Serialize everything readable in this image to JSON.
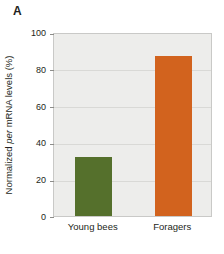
{
  "panel": {
    "label": "A"
  },
  "chart_data": {
    "type": "bar",
    "title": "",
    "xlabel": "",
    "ylabel_prefix": "Normalized ",
    "ylabel_gene": "per",
    "ylabel_suffix": " mRNA levels (%)",
    "ylabel_full": "Normalized per mRNA levels (%)",
    "categories": [
      "Young bees",
      "Foragers"
    ],
    "values": [
      32,
      87
    ],
    "series": [
      {
        "name": "per mRNA",
        "values": [
          32,
          87
        ]
      }
    ],
    "ylim": [
      0,
      100
    ],
    "yticks": [
      0,
      20,
      40,
      60,
      80,
      100
    ],
    "ytick_labels": [
      "0",
      "20",
      "40",
      "60",
      "80",
      "100"
    ],
    "grid": true,
    "legend": "none",
    "bar_colors": [
      "#55702c",
      "#d2631e"
    ],
    "plot_background": "#ededeb",
    "page_background": "#ffffff"
  }
}
